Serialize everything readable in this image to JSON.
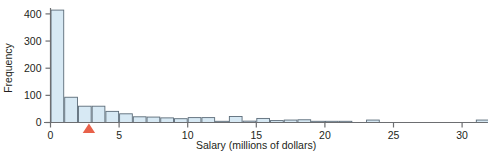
{
  "chart_data": {
    "type": "bar",
    "title": "",
    "subtitle": "",
    "xlabel": "Salary (millions of dollars)",
    "ylabel": "Frequency",
    "xlim": [
      0,
      32.5
    ],
    "ylim": [
      0,
      430
    ],
    "xticks": [
      0,
      5,
      10,
      15,
      20,
      25,
      30
    ],
    "xticklabels": [
      "0",
      "5",
      "10",
      "15",
      "20",
      "25",
      "30"
    ],
    "yticks": [
      0,
      100,
      200,
      300,
      400
    ],
    "yticklabels": [
      "0",
      "100",
      "200",
      "300",
      "400"
    ],
    "grid": false,
    "legend": null,
    "bin_width": 1,
    "bin_starts": [
      0,
      1,
      2,
      3,
      4,
      5,
      6,
      7,
      8,
      9,
      10,
      11,
      12,
      13,
      14,
      15,
      16,
      17,
      18,
      19,
      20,
      21,
      22,
      23,
      24,
      25,
      26,
      27,
      28,
      29,
      30,
      31,
      32
    ],
    "categories": [
      "0-1",
      "1-2",
      "2-3",
      "3-4",
      "4-5",
      "5-6",
      "6-7",
      "7-8",
      "8-9",
      "9-10",
      "10-11",
      "11-12",
      "12-13",
      "13-14",
      "14-15",
      "15-16",
      "16-17",
      "17-18",
      "18-19",
      "19-20",
      "20-21",
      "21-22",
      "22-23",
      "23-24",
      "24-25",
      "25-26",
      "26-27",
      "27-28",
      "28-29",
      "29-30",
      "30-31",
      "31-32",
      "32-33"
    ],
    "values": [
      414,
      93,
      60,
      60,
      41,
      32,
      21,
      20,
      17,
      14,
      18,
      18,
      4,
      22,
      5,
      15,
      7,
      9,
      10,
      2,
      4,
      1,
      0,
      9,
      0,
      0,
      0,
      0,
      0,
      0,
      0,
      9,
      0
    ],
    "bar_fill_color": "#d7e9f4",
    "bar_edge_color": "#5b6b78",
    "axis_color": "#6d6e71",
    "marker": {
      "name": "mean-marker",
      "shape": "triangle-up",
      "color": "#e8614a",
      "x_value": 2.8,
      "y_value": 0
    }
  },
  "colors": {
    "background": "#ffffff",
    "text": "#231f20",
    "bar_fill": "#d7e9f4",
    "bar_edge": "#5b6b78",
    "axis": "#6d6e71",
    "marker": "#e8614a"
  }
}
